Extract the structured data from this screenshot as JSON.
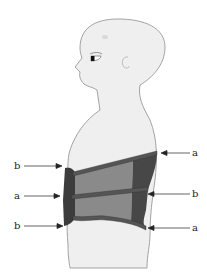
{
  "diagram": {
    "colors": {
      "skin": "#efefef",
      "outline": "#9a9a9a",
      "brace_dark": "#3c3c3c",
      "brace_mid": "#555555",
      "brace_panel": "#8a8a8a",
      "arrow": "#222222"
    },
    "labels": {
      "left": [
        {
          "text": "b",
          "y": 167
        },
        {
          "text": "a",
          "y": 196
        },
        {
          "text": "b",
          "y": 226
        }
      ],
      "right": [
        {
          "text": "a",
          "y": 153
        },
        {
          "text": "b",
          "y": 196
        },
        {
          "text": "a",
          "y": 228
        }
      ]
    }
  }
}
